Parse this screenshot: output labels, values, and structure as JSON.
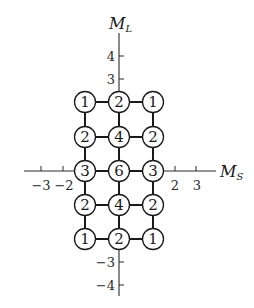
{
  "diagram": {
    "title": "",
    "axes": {
      "vertical": {
        "label": "M",
        "subscript": "L",
        "tick_labels": [
          "4",
          "3",
          "−3",
          "−4"
        ]
      },
      "horizontal": {
        "label": "M",
        "subscript": "S",
        "tick_labels": [
          "−3",
          "−2",
          "2",
          "3"
        ]
      }
    },
    "grid": {
      "ms_values": [
        -1,
        0,
        1
      ],
      "ml_values": [
        2,
        1,
        0,
        -1,
        -2
      ],
      "rows": [
        [
          "1",
          "2",
          "1"
        ],
        [
          "2",
          "4",
          "2"
        ],
        [
          "3",
          "6",
          "3"
        ],
        [
          "2",
          "4",
          "2"
        ],
        [
          "1",
          "2",
          "1"
        ]
      ]
    }
  }
}
